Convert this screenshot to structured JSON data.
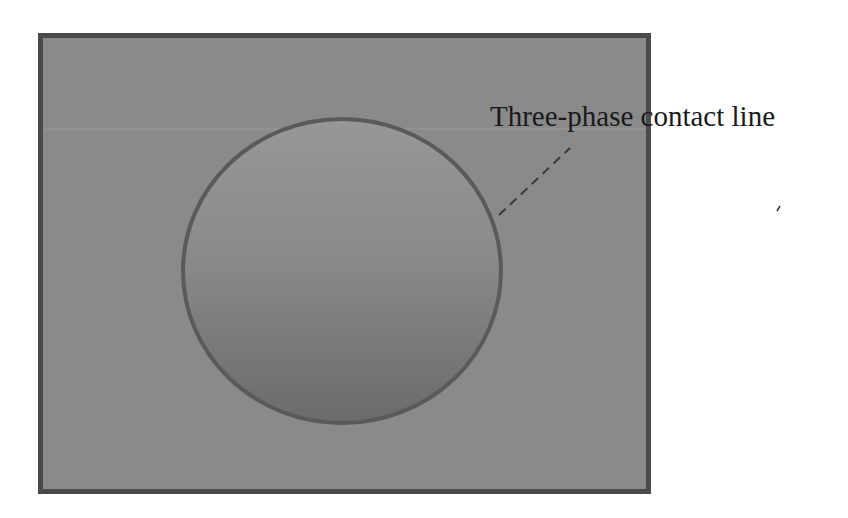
{
  "diagram": {
    "annotation": {
      "label": "Three-phase contact line"
    },
    "colors": {
      "background": "#ffffff",
      "substrate_fill": "#8a8a8a",
      "substrate_border": "#4a4a4a",
      "droplet_top": "#959595",
      "droplet_bottom": "#6e6e6e",
      "droplet_border": "#5a5a5a",
      "leader_line": "#3a3a3a"
    },
    "elements": [
      {
        "id": "substrate",
        "shape": "rectangle"
      },
      {
        "id": "droplet",
        "shape": "ellipse"
      },
      {
        "id": "leader",
        "shape": "dashed-line"
      }
    ]
  }
}
